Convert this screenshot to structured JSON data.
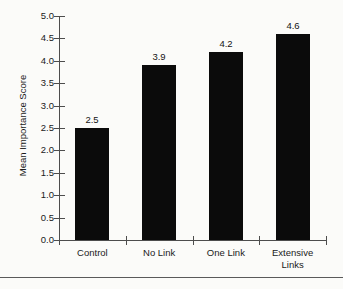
{
  "chart_data": {
    "type": "bar",
    "title": "",
    "subtitle": "",
    "xlabel": "",
    "ylabel": "Mean Importance Score",
    "categories": [
      "Control",
      "No Link",
      "One Link",
      "Extensive Links"
    ],
    "category_lines": [
      [
        "Control"
      ],
      [
        "No Link"
      ],
      [
        "One Link"
      ],
      [
        "Extensive",
        "Links"
      ]
    ],
    "values": [
      2.5,
      3.9,
      4.2,
      4.6
    ],
    "value_labels": [
      "2.5",
      "3.9",
      "4.2",
      "4.6"
    ],
    "ylim": [
      0.0,
      5.0
    ],
    "ytick_values": [
      5.0,
      4.5,
      4.0,
      3.5,
      3.0,
      2.5,
      2.0,
      1.5,
      1.0,
      0.5,
      0.0
    ],
    "ytick_labels": [
      "5.0",
      "4.5",
      "4.0",
      "3.5",
      "3.0",
      "2.5",
      "2.0",
      "1.5",
      "1.0",
      "0.5",
      "0.0"
    ],
    "grid": false,
    "legend": false,
    "legend_position": "none",
    "bar_color": "#0b0b0b",
    "axis_color": "#4d4d4d",
    "text_color": "#1a1a1a",
    "background_color": "#fbfbf9"
  },
  "figure": {
    "bottom_rule_visible": true
  }
}
